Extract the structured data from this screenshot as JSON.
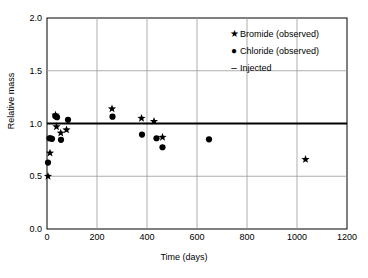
{
  "chart_data": {
    "type": "scatter",
    "title": "",
    "xlabel": "Time (days)",
    "ylabel": "Relative mass",
    "xlim": [
      0,
      1200
    ],
    "ylim": [
      0.0,
      2.0
    ],
    "xticks": [
      0,
      200,
      400,
      600,
      800,
      1000,
      1200
    ],
    "yticks": [
      "0.0",
      "0.5",
      "1.0",
      "1.5",
      "2.0"
    ],
    "grid": true,
    "legend_position": "top-right",
    "legend": [
      {
        "symbol": "★",
        "label": "Bromide (observed)"
      },
      {
        "symbol": "●",
        "label": "Chloride (observed)"
      },
      {
        "symbol": "–",
        "label": "Injected"
      }
    ],
    "series": [
      {
        "name": "Bromide (observed)",
        "marker": "star",
        "color": "#000000",
        "points": [
          {
            "x": 4,
            "y": 0.5
          },
          {
            "x": 12,
            "y": 0.72
          },
          {
            "x": 34,
            "y": 1.08
          },
          {
            "x": 38,
            "y": 0.97
          },
          {
            "x": 55,
            "y": 0.91
          },
          {
            "x": 78,
            "y": 0.94
          },
          {
            "x": 260,
            "y": 1.14
          },
          {
            "x": 378,
            "y": 1.05
          },
          {
            "x": 428,
            "y": 1.02
          },
          {
            "x": 462,
            "y": 0.87
          },
          {
            "x": 1034,
            "y": 0.66
          }
        ]
      },
      {
        "name": "Chloride (observed)",
        "marker": "circle",
        "color": "#000000",
        "points": [
          {
            "x": 4,
            "y": 0.63
          },
          {
            "x": 10,
            "y": 0.86
          },
          {
            "x": 14,
            "y": 0.86
          },
          {
            "x": 20,
            "y": 0.855
          },
          {
            "x": 33,
            "y": 1.07
          },
          {
            "x": 40,
            "y": 1.06
          },
          {
            "x": 56,
            "y": 0.845
          },
          {
            "x": 84,
            "y": 1.035
          },
          {
            "x": 262,
            "y": 1.065
          },
          {
            "x": 380,
            "y": 0.895
          },
          {
            "x": 438,
            "y": 0.86
          },
          {
            "x": 462,
            "y": 0.775
          },
          {
            "x": 648,
            "y": 0.85
          }
        ]
      }
    ],
    "reference_line": {
      "name": "Injected",
      "orientation": "horizontal",
      "value": 1.0,
      "color": "#000000"
    }
  }
}
